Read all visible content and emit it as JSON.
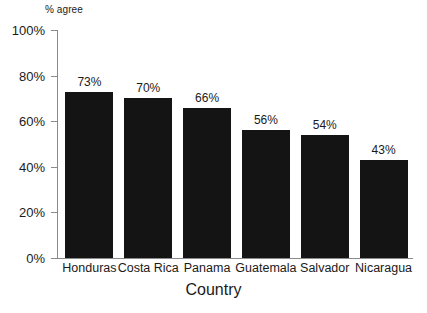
{
  "chart_data": {
    "type": "bar",
    "title": "",
    "subtitle": "",
    "xlabel": "Country",
    "ylabel": "% agree",
    "categories": [
      "Honduras",
      "Costa Rica",
      "Panama",
      "Guatemala",
      "Salvador",
      "Nicaragua"
    ],
    "values": [
      73,
      70,
      66,
      56,
      54,
      43
    ],
    "data_labels": [
      "73%",
      "70%",
      "66%",
      "56%",
      "54%",
      "43%"
    ],
    "ylim": [
      0,
      100
    ],
    "ytick_values": [
      100,
      80,
      60,
      40,
      20,
      0
    ],
    "ytick_labels": [
      "100%",
      "80%",
      "60%",
      "40%",
      "20%",
      "0%"
    ],
    "grid": false,
    "legend": null,
    "legend_position": "none",
    "bar_color": "#141414",
    "axis_color": "#8a8a8a",
    "text_color": "#1a1a1a",
    "background_color": "#ffffff"
  }
}
